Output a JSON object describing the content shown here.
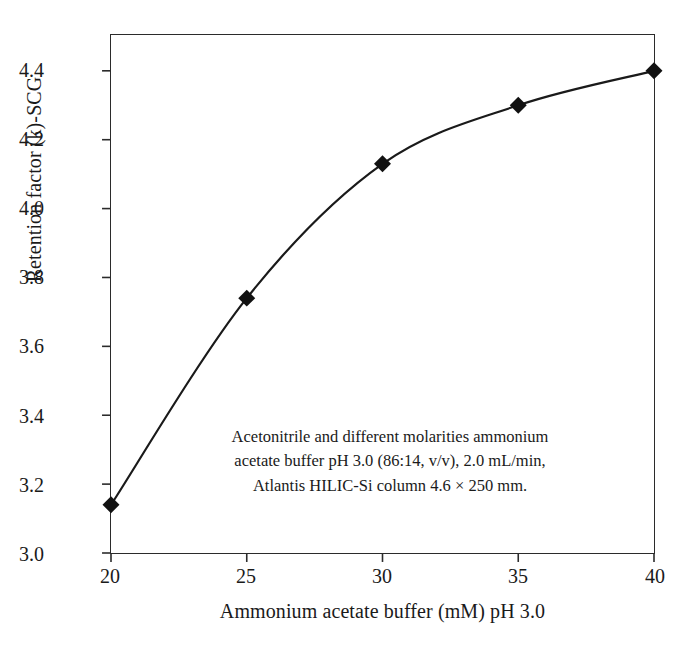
{
  "chart_data": {
    "type": "line",
    "title": "",
    "xlabel": "Ammonium acetate buffer (mM) pH 3.0",
    "ylabel": "Retention factor (k)-SCG",
    "x": [
      20,
      25,
      30,
      35,
      40
    ],
    "values": [
      3.14,
      3.74,
      4.13,
      4.3,
      4.4
    ],
    "series": [
      {
        "name": "SCG",
        "values": [
          3.14,
          3.74,
          4.13,
          4.3,
          4.4
        ]
      }
    ],
    "xlim": [
      20,
      40
    ],
    "ylim": [
      3.0,
      4.504
    ],
    "xticks": [
      "20",
      "25",
      "30",
      "35",
      "40"
    ],
    "xtick_values": [
      20,
      25,
      30,
      35,
      40
    ],
    "yticks": [
      "3.0",
      "3.2",
      "3.4",
      "3.6",
      "3.8",
      "4.0",
      "4.2",
      "4.4"
    ],
    "ytick_values": [
      3.0,
      3.2,
      3.4,
      3.6,
      3.8,
      4.0,
      4.2,
      4.4
    ],
    "grid": false,
    "legend": "none",
    "marker": "filled-diamond",
    "line_color": "#1a1a1a",
    "marker_color": "#111111",
    "background_color": "#ffffff",
    "frame_color": "#2b2b2b",
    "annotation": {
      "lines": [
        "Acetonitrile and different molarities ammonium",
        "acetate buffer pH 3.0 (86:14, v/v), 2.0 mL/min,",
        "Atlantis HILIC-Si column 4.6 × 250 mm."
      ],
      "text": "Acetonitrile and different molarities ammonium acetate buffer pH 3.0 (86:14, v/v), 2.0 mL/min, Atlantis HILIC-Si column 4.6 × 250 mm."
    }
  }
}
